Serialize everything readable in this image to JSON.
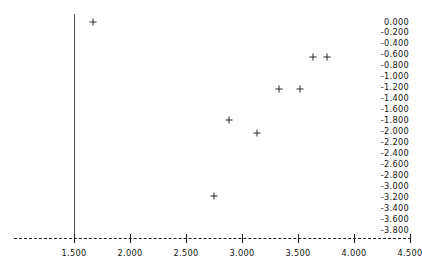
{
  "chart_data": {
    "type": "scatter",
    "title": "",
    "subtitle": "",
    "xlabel": "",
    "ylabel": "",
    "xlim": [
      1.25,
      4.55
    ],
    "ylim": [
      -3.9,
      0.1
    ],
    "grid": false,
    "legend": null,
    "marker": "plus",
    "marker_color": "#2a2a2a",
    "xticks": [
      1.5,
      2.0,
      2.5,
      3.0,
      3.5,
      4.0,
      4.5
    ],
    "xtick_labels": [
      "1.500",
      "2.000",
      "2.500",
      "3.000",
      "3.500",
      "4.000",
      "4.500"
    ],
    "yticks": [
      0.0,
      -0.2,
      -0.4,
      -0.6,
      -0.8,
      -1.0,
      -1.2,
      -1.4,
      -1.6,
      -1.8,
      -2.0,
      -2.2,
      -2.4,
      -2.6,
      -2.8,
      -3.0,
      -3.2,
      -3.4,
      -3.6,
      -3.8
    ],
    "ytick_labels": [
      "0.000",
      "-0.200",
      "-0.400",
      "-0.600",
      "-0.800",
      "-1.000",
      "-1.200",
      "-1.400",
      "-1.600",
      "-1.800",
      "-2.000",
      "-2.200",
      "-2.400",
      "-2.600",
      "-2.800",
      "-3.000",
      "-3.200",
      "-3.400",
      "-3.600",
      "-3.800"
    ],
    "points": [
      {
        "x": 1.67,
        "y": 0.0
      },
      {
        "x": 2.75,
        "y": -3.18
      },
      {
        "x": 2.88,
        "y": -1.79
      },
      {
        "x": 3.13,
        "y": -2.03
      },
      {
        "x": 3.33,
        "y": -1.22
      },
      {
        "x": 3.52,
        "y": -1.22
      },
      {
        "x": 3.63,
        "y": -0.64
      },
      {
        "x": 3.76,
        "y": -0.64
      }
    ]
  },
  "axes": {
    "y_axis_color": "#555555",
    "x_axis_color": "#1d1d1d",
    "x_axis_style": "dashed"
  }
}
